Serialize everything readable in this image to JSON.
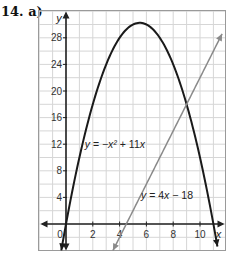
{
  "problem": {
    "label": "14. a)"
  },
  "chart_data": {
    "type": "line",
    "title": "",
    "xlabel": "x",
    "ylabel": "y",
    "xlim": [
      -1.9,
      11.9
    ],
    "ylim": [
      -4,
      32
    ],
    "grid": true,
    "x_ticks": [
      0,
      2,
      4,
      6,
      8,
      10
    ],
    "y_ticks": [
      4,
      8,
      12,
      16,
      20,
      24,
      28
    ],
    "x_tick_labels": [
      "0",
      "2",
      "4",
      "6",
      "8",
      "10"
    ],
    "y_tick_labels": [
      "4",
      "8",
      "12",
      "16",
      "20",
      "24",
      "28"
    ],
    "series": [
      {
        "name": "y = −x² + 11x",
        "kind": "quadratic",
        "a": -1,
        "b": 11,
        "c": 0,
        "color": "#1a1a1a",
        "x_range": [
          -0.35,
          11.3
        ]
      },
      {
        "name": "y = 4x − 18",
        "kind": "linear",
        "m": 4,
        "b": -18,
        "color": "#8a8a8a",
        "x_range": [
          3.5,
          11.65
        ]
      }
    ],
    "annotations": [
      {
        "text": "y = −x² + 11x",
        "x": 1.4,
        "y": 11.5
      },
      {
        "text": "y = 4x − 18",
        "x": 5.6,
        "y": 3.8
      }
    ],
    "intersections": [
      [
        2,
        14
      ],
      [
        9,
        18
      ]
    ],
    "vertex": [
      5.5,
      30.25
    ]
  }
}
